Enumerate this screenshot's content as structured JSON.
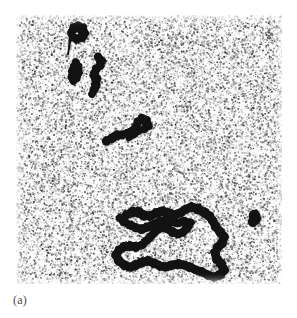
{
  "figure": {
    "caption": "(a)",
    "panel_label": "(a)",
    "alt_description": "Noisy speckled monochrome micrograph with dark branching clusters"
  },
  "colors": {
    "background": "#ffffff",
    "panel_background": "#fbfbfb",
    "noise_dark": "#2a2a2a",
    "noise_mid": "#6f6f6f",
    "noise_light": "#b4b4b4",
    "cluster_fill": "#141414",
    "caption_text": "#4a4a4a"
  },
  "panel_geometry": {
    "left": 16,
    "top": 15,
    "width": 266,
    "height": 269
  },
  "chart_data": {
    "type": "scatter",
    "title": "",
    "subtitle": "",
    "xlabel": "",
    "ylabel": "",
    "xlim": [
      0,
      266
    ],
    "ylim": [
      0,
      269
    ],
    "grid": false,
    "legend": "none",
    "annotations": [
      "(a)"
    ],
    "noise": {
      "description": "salt-and-pepper speckle background",
      "point_count": 17000,
      "seed": 20240517,
      "dot_size_px": [
        0.6,
        1.9
      ],
      "gray_levels": [
        "#2a2a2a",
        "#5a5a5a",
        "#8c8c8c",
        "#b4b4b4"
      ]
    },
    "clusters": [
      {
        "name": "cluster-top-blob",
        "bbox": [
          44,
          8,
          26,
          24
        ],
        "area_px": 190,
        "nodes": [
          [
            58,
            13
          ],
          [
            62,
            12
          ],
          [
            66,
            14
          ],
          [
            68,
            18
          ],
          [
            66,
            22
          ],
          [
            61,
            24
          ],
          [
            57,
            22
          ],
          [
            55,
            18
          ],
          [
            54,
            26
          ],
          [
            53,
            33
          ],
          [
            52,
            39
          ]
        ],
        "radii": [
          5.0,
          5.4,
          5.6,
          5.2,
          5.0,
          4.6,
          4.4,
          4.2,
          1.6,
          1.2,
          1.0
        ]
      },
      {
        "name": "cluster-upper-left-arm",
        "bbox": [
          50,
          42,
          20,
          32
        ],
        "area_px": 150,
        "nodes": [
          [
            60,
            47
          ],
          [
            62,
            52
          ],
          [
            62,
            58
          ],
          [
            60,
            63
          ],
          [
            57,
            66
          ],
          [
            55,
            62
          ],
          [
            56,
            56
          ],
          [
            58,
            51
          ]
        ],
        "radii": [
          4.0,
          4.6,
          4.8,
          4.6,
          3.8,
          3.6,
          3.8,
          3.8
        ]
      },
      {
        "name": "cluster-upper-right-arm",
        "bbox": [
          72,
          38,
          24,
          46
        ],
        "area_px": 230,
        "nodes": [
          [
            82,
            42
          ],
          [
            85,
            46
          ],
          [
            84,
            51
          ],
          [
            80,
            54
          ],
          [
            78,
            59
          ],
          [
            80,
            64
          ],
          [
            80,
            70
          ],
          [
            78,
            75
          ],
          [
            76,
            79
          ]
        ],
        "radii": [
          4.4,
          4.8,
          4.6,
          4.4,
          4.6,
          5.0,
          5.0,
          4.6,
          4.0
        ]
      },
      {
        "name": "cluster-middle-chain",
        "bbox": [
          84,
          98,
          52,
          32
        ],
        "area_px": 420,
        "nodes": [
          [
            90,
            126
          ],
          [
            96,
            123
          ],
          [
            101,
            120
          ],
          [
            106,
            120
          ],
          [
            111,
            118
          ],
          [
            116,
            116
          ],
          [
            120,
            112
          ],
          [
            122,
            107
          ],
          [
            126,
            104
          ],
          [
            130,
            106
          ],
          [
            132,
            111
          ],
          [
            128,
            114
          ],
          [
            123,
            116
          ],
          [
            118,
            120
          ],
          [
            113,
            123
          ]
        ],
        "radii": [
          4.6,
          5.0,
          5.0,
          4.6,
          4.4,
          4.4,
          4.4,
          4.4,
          4.8,
          5.2,
          4.8,
          4.0,
          3.6,
          3.4,
          3.4
        ]
      },
      {
        "name": "cluster-main-large",
        "bbox": [
          94,
          180,
          128,
          88
        ],
        "area_px": 2600,
        "nodes": [
          [
            110,
            200
          ],
          [
            116,
            197
          ],
          [
            122,
            197
          ],
          [
            128,
            200
          ],
          [
            134,
            201
          ],
          [
            140,
            198
          ],
          [
            146,
            196
          ],
          [
            152,
            198
          ],
          [
            158,
            200
          ],
          [
            164,
            198
          ],
          [
            170,
            194
          ],
          [
            176,
            192
          ],
          [
            182,
            194
          ],
          [
            188,
            197
          ],
          [
            193,
            201
          ],
          [
            197,
            206
          ],
          [
            200,
            212
          ],
          [
            204,
            217
          ],
          [
            208,
            222
          ],
          [
            206,
            228
          ],
          [
            202,
            232
          ],
          [
            199,
            238
          ],
          [
            201,
            244
          ],
          [
            205,
            249
          ],
          [
            208,
            255
          ],
          [
            204,
            260
          ],
          [
            198,
            262
          ],
          [
            192,
            260
          ],
          [
            186,
            257
          ],
          [
            180,
            255
          ],
          [
            174,
            252
          ],
          [
            168,
            250
          ],
          [
            162,
            249
          ],
          [
            156,
            250
          ],
          [
            150,
            252
          ],
          [
            144,
            251
          ],
          [
            138,
            248
          ],
          [
            132,
            246
          ],
          [
            126,
            247
          ],
          [
            120,
            250
          ],
          [
            114,
            252
          ],
          [
            108,
            250
          ],
          [
            103,
            246
          ],
          [
            100,
            240
          ],
          [
            103,
            235
          ],
          [
            108,
            232
          ],
          [
            114,
            231
          ],
          [
            120,
            232
          ],
          [
            126,
            230
          ],
          [
            130,
            226
          ],
          [
            134,
            222
          ],
          [
            138,
            218
          ],
          [
            142,
            214
          ],
          [
            147,
            212
          ],
          [
            152,
            214
          ],
          [
            157,
            217
          ],
          [
            162,
            219
          ],
          [
            167,
            217
          ],
          [
            171,
            213
          ],
          [
            174,
            208
          ],
          [
            168,
            206
          ],
          [
            162,
            208
          ],
          [
            156,
            207
          ],
          [
            150,
            205
          ],
          [
            144,
            206
          ],
          [
            138,
            209
          ],
          [
            132,
            212
          ],
          [
            126,
            214
          ],
          [
            120,
            213
          ],
          [
            114,
            210
          ],
          [
            108,
            207
          ],
          [
            104,
            203
          ]
        ],
        "radii": [
          4.8,
          5.2,
          5.4,
          5.2,
          5.0,
          4.8,
          5.0,
          5.2,
          5.2,
          5.0,
          4.8,
          5.0,
          5.2,
          5.2,
          5.0,
          4.8,
          4.8,
          5.0,
          5.2,
          5.0,
          4.8,
          4.8,
          5.0,
          5.0,
          5.2,
          5.0,
          4.8,
          4.8,
          4.8,
          4.8,
          4.8,
          4.8,
          5.0,
          5.0,
          4.8,
          4.8,
          4.8,
          5.0,
          5.0,
          5.0,
          4.8,
          4.8,
          4.8,
          4.8,
          4.8,
          5.0,
          5.0,
          4.8,
          4.6,
          4.6,
          4.6,
          4.6,
          4.8,
          5.0,
          5.0,
          4.8,
          4.6,
          4.6,
          4.6,
          4.6,
          4.4,
          4.4,
          4.4,
          4.4,
          4.4,
          4.6,
          4.8,
          4.8,
          4.6,
          4.4,
          4.4,
          4.2
        ]
      },
      {
        "name": "cluster-isolated-right-blob",
        "bbox": [
          230,
          193,
          16,
          16
        ],
        "area_px": 120,
        "nodes": [
          [
            238,
            200
          ],
          [
            239,
            204
          ],
          [
            237,
            207
          ]
        ],
        "radii": [
          5.6,
          5.8,
          5.2
        ]
      }
    ]
  }
}
